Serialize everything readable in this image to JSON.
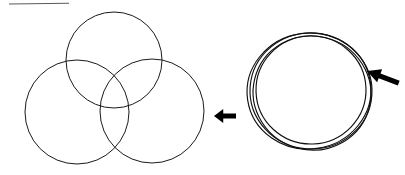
{
  "figure": {
    "background_color": "#ffffff",
    "stroke_color": "#1a1a1a",
    "arrow_color": "#000000",
    "rule_color": "#5a5a5a",
    "width": 405,
    "height": 175,
    "top_rule": {
      "name": "top-horizontal-rule",
      "x1": 9,
      "y1": 4,
      "x2": 69,
      "y2": 3.2
    },
    "venn": {
      "label": "three-circle-venn-diagram",
      "circles": [
        {
          "name": "top-circle",
          "cx": 114,
          "cy": 60,
          "r": 48
        },
        {
          "name": "left-circle",
          "cx": 77,
          "cy": 112,
          "r": 52
        },
        {
          "name": "right-circle",
          "cx": 152,
          "cy": 111,
          "r": 52
        }
      ]
    },
    "coil": {
      "label": "overlapping-concentric-circles",
      "circles": [
        {
          "name": "coil-circle-1",
          "cx": 309,
          "cy": 91,
          "rx": 62,
          "ry": 58,
          "rotation": -8
        },
        {
          "name": "coil-circle-2",
          "cx": 311,
          "cy": 91,
          "rx": 61,
          "ry": 58,
          "rotation": 4
        },
        {
          "name": "coil-circle-3",
          "cx": 312,
          "cy": 93,
          "rx": 59,
          "ry": 57,
          "rotation": 14
        },
        {
          "name": "coil-circle-4",
          "cx": 311,
          "cy": 90,
          "rx": 55,
          "ry": 54,
          "rotation": -2
        }
      ]
    },
    "arrows": [
      {
        "name": "arrow-left-middle",
        "direction": "left",
        "tip_x": 214,
        "tip_y": 116,
        "tail_x": 236,
        "tail_y": 116,
        "angle_deg": 0
      },
      {
        "name": "arrow-left-upper-right",
        "direction": "left-down",
        "tip_x": 367,
        "tip_y": 71,
        "tail_x": 401,
        "tail_y": 58,
        "angle_deg": 21
      }
    ]
  }
}
